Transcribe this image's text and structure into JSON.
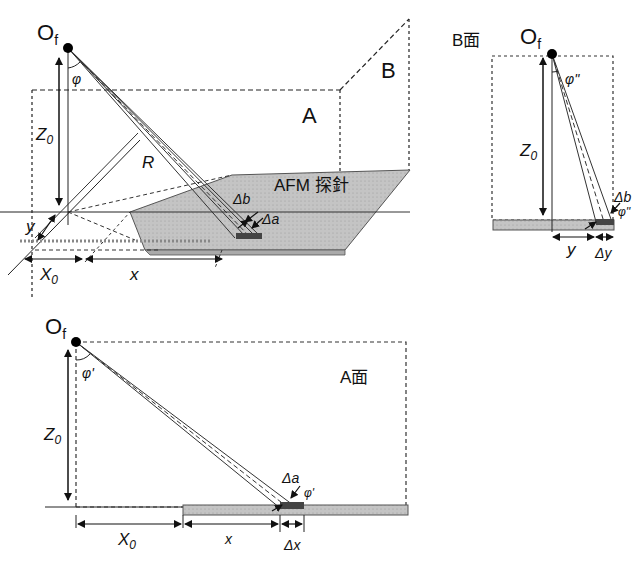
{
  "figure": {
    "type": "AFM cantilever laser deflection geometry",
    "colors": {
      "line": "#222222",
      "probe_fill": "#bdbdbd",
      "spot_fill": "#444444",
      "background": "#ffffff"
    }
  },
  "perspective": {
    "focus_label": "O",
    "focus_sub": "f",
    "angle_label": "φ",
    "height_label": "Z",
    "height_sub": "0",
    "plane_a_label": "A",
    "plane_b_label": "B",
    "radius_label": "R",
    "probe_label": "AFM 探針",
    "delta_b_label": "Δb",
    "delta_a_label": "Δa",
    "y_label": "y",
    "x0_label": "X",
    "x0_sub": "0",
    "x_label": "x"
  },
  "b_plane_view": {
    "title": "B面",
    "focus_label": "O",
    "focus_sub": "f",
    "angle_label": "φ''",
    "height_label": "Z",
    "height_sub": "0",
    "delta_b_label": "Δb",
    "angle2_label": "φ''",
    "y_label": "y",
    "delta_y_label": "Δy"
  },
  "a_plane_view": {
    "title": "A面",
    "focus_label": "O",
    "focus_sub": "f",
    "angle_label": "φ'",
    "height_label": "Z",
    "height_sub": "0",
    "delta_a_label": "Δa",
    "angle2_label": "φ'",
    "x0_label": "X",
    "x0_sub": "0",
    "x_label": "x",
    "delta_x_label": "Δx"
  }
}
